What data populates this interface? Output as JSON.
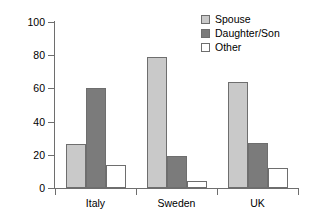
{
  "chart_data": {
    "type": "bar",
    "title": "",
    "subtitle": "",
    "xlabel": "",
    "ylabel": "Percentage (%)",
    "ylim": [
      0,
      100
    ],
    "yticks": [
      0,
      20,
      40,
      60,
      80,
      100
    ],
    "ytick_labels": [
      "0",
      "20",
      "40",
      "60",
      "80",
      "100"
    ],
    "grid": false,
    "legend_position": "top-right",
    "categories": [
      "Italy",
      "Sweden",
      "UK"
    ],
    "series": [
      {
        "name": "Spouse",
        "values": [
          26.5,
          79.0,
          64.0
        ],
        "color": "#c9c9c9"
      },
      {
        "name": "Daughter/Son",
        "values": [
          60.0,
          19.0,
          27.0
        ],
        "color": "#7b7b7b"
      },
      {
        "name": "Other",
        "values": [
          14.0,
          4.5,
          12.0
        ],
        "color": "#ffffff"
      }
    ],
    "annotations": []
  },
  "legend": {
    "items": [
      {
        "label": "Spouse",
        "swatch": "legend-swatch-spouse"
      },
      {
        "label": "Daughter/Son",
        "swatch": "legend-swatch-daughter-son"
      },
      {
        "label": "Other",
        "swatch": "legend-swatch-other"
      }
    ]
  },
  "colors": {
    "spouse": "#c9c9c9",
    "daughter_son": "#7b7b7b",
    "other": "#ffffff",
    "axis": "#6e6e6e",
    "text": "#000000",
    "background": "#ffffff"
  }
}
